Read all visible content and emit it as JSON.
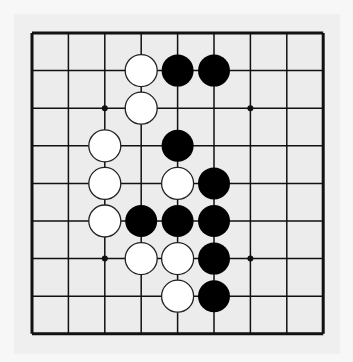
{
  "board": {
    "size": 9,
    "origin": [
      32,
      33
    ],
    "spacing": [
      36.4,
      37.6
    ],
    "background": "#ececec",
    "line_color": "#111111",
    "star_points": [
      [
        2,
        2
      ],
      [
        6,
        2
      ],
      [
        2,
        6
      ],
      [
        6,
        6
      ]
    ],
    "stones": [
      {
        "color": "white",
        "col": 3,
        "row": 1
      },
      {
        "color": "black",
        "col": 4,
        "row": 1
      },
      {
        "color": "black",
        "col": 5,
        "row": 1
      },
      {
        "color": "white",
        "col": 3,
        "row": 2
      },
      {
        "color": "white",
        "col": 2,
        "row": 3
      },
      {
        "color": "black",
        "col": 4,
        "row": 3
      },
      {
        "color": "white",
        "col": 2,
        "row": 4
      },
      {
        "color": "white",
        "col": 4,
        "row": 4
      },
      {
        "color": "black",
        "col": 5,
        "row": 4
      },
      {
        "color": "white",
        "col": 2,
        "row": 5
      },
      {
        "color": "black",
        "col": 3,
        "row": 5
      },
      {
        "color": "black",
        "col": 4,
        "row": 5
      },
      {
        "color": "black",
        "col": 5,
        "row": 5
      },
      {
        "color": "white",
        "col": 3,
        "row": 6
      },
      {
        "color": "white",
        "col": 4,
        "row": 6
      },
      {
        "color": "black",
        "col": 5,
        "row": 6
      },
      {
        "color": "white",
        "col": 4,
        "row": 7
      },
      {
        "color": "black",
        "col": 5,
        "row": 7
      }
    ]
  }
}
